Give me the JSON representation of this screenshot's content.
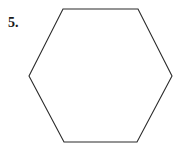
{
  "figure": {
    "problem_number": "5.",
    "shape_name": "hexagon",
    "shape_sides": 6,
    "orientation": "flat-top",
    "stroke_color": "#2b2b2b",
    "fill_color": "#ffffff",
    "background_color": "#ffffff",
    "stroke_width": 1.1,
    "vertices": [
      [
        63,
        9
      ],
      [
        138,
        9
      ],
      [
        172,
        76
      ],
      [
        137,
        142
      ],
      [
        64,
        142
      ],
      [
        29,
        76
      ]
    ],
    "points_attr": "63,9 138,9 172,76 137,142 64,142 29,76"
  }
}
